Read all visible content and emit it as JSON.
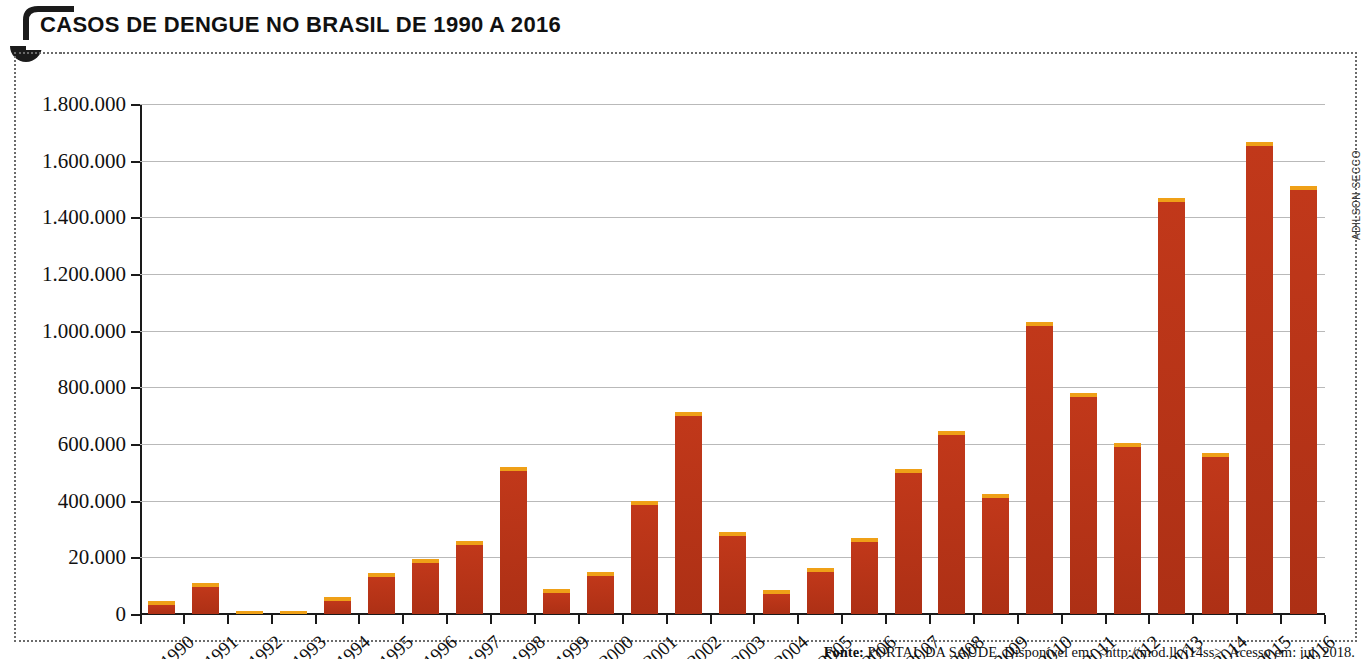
{
  "title": "CASOS DE DENGUE NO BRASIL DE 1990 A 2016",
  "credit": "ADILSON SECCO",
  "source": {
    "prefix": "Fonte:",
    "text": " PORTAL DA SAÚDE. Disponível em: <http://mod.lk/j14ss>. Acesso em: jul. 2018."
  },
  "colors": {
    "bar_body": "#b33317",
    "bar_cap": "#efa017",
    "axis": "#1a1a1a",
    "grid": "#b9b9b9",
    "frame": "#6b6b6b"
  },
  "chart_data": {
    "type": "bar",
    "title": "CASOS DE DENGUE NO BRASIL DE 1990 A 2016",
    "xlabel": "",
    "ylabel": "",
    "ylim": [
      0,
      1800000
    ],
    "grid": true,
    "legend": "none",
    "ytick_labels": [
      "0",
      "20.000",
      "400.000",
      "600.000",
      "800.000",
      "1.000.000",
      "1.200.000",
      "1.400.000",
      "1.600.000",
      "1.800.000"
    ],
    "ytick_values": [
      0,
      200000,
      400000,
      600000,
      800000,
      1000000,
      1200000,
      1400000,
      1600000,
      1800000
    ],
    "categories": [
      "1990",
      "1991",
      "1992",
      "1993",
      "1994",
      "1995",
      "1996",
      "1997",
      "1998",
      "1999",
      "2000",
      "2001",
      "2002",
      "2003",
      "2004",
      "2005",
      "2006",
      "2007",
      "2008",
      "2009",
      "2010",
      "2011",
      "2012",
      "2013",
      "2014",
      "2015",
      "2016"
    ],
    "values": [
      45000,
      110000,
      5000,
      6000,
      60000,
      145000,
      193000,
      258000,
      520000,
      88000,
      150000,
      400000,
      712000,
      290000,
      85000,
      163000,
      270000,
      513000,
      645000,
      423000,
      1030000,
      780000,
      605000,
      1468000,
      570000,
      1665000,
      1510000
    ]
  }
}
